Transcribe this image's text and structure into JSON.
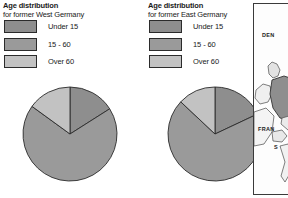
{
  "panels": [
    {
      "id": "west",
      "title": "Age distribution",
      "subtitle": "for former West Germany"
    },
    {
      "id": "east",
      "title": "Age distribution",
      "subtitle": "for former East Germany"
    }
  ],
  "legend": {
    "items": [
      {
        "label": "Under 15",
        "color": "#8e8e8e"
      },
      {
        "label": "15 - 60",
        "color": "#9a9a9a"
      },
      {
        "label": "Over 60",
        "color": "#c2c2c2"
      }
    ]
  },
  "map": {
    "labels": [
      {
        "name": "denmark-label",
        "text": "DEN"
      },
      {
        "name": "france-label",
        "text": "FRAN"
      },
      {
        "name": "switzerland-label",
        "text": "S"
      }
    ]
  },
  "caption": {
    "text": ""
  },
  "chart_data": [
    {
      "type": "pie",
      "title": "Age distribution for former West Germany",
      "categories": [
        "Under 15",
        "15 - 60",
        "Over 60"
      ],
      "values": [
        16,
        69,
        15
      ],
      "colors": [
        "#8e8e8e",
        "#9a9a9a",
        "#c2c2c2"
      ],
      "legend_position": "top-left",
      "start_angle_deg": 0,
      "direction": "clockwise"
    },
    {
      "type": "pie",
      "title": "Age distribution for former East Germany",
      "categories": [
        "Under 15",
        "15 - 60",
        "Over 60"
      ],
      "values": [
        18,
        69,
        13
      ],
      "colors": [
        "#8e8e8e",
        "#9a9a9a",
        "#c2c2c2"
      ],
      "legend_position": "top-left",
      "start_angle_deg": 0,
      "direction": "clockwise"
    }
  ]
}
